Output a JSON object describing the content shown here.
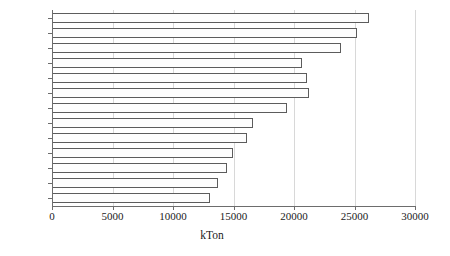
{
  "chart_data": {
    "type": "bar",
    "orientation": "horizontal",
    "title": "",
    "xlabel": "kTon",
    "ylabel": "",
    "categories": [
      "2009",
      "2010",
      "2011",
      "2012",
      "2013",
      "2014",
      "2015",
      "2016",
      "2017",
      "2018",
      "2019",
      "2020",
      "2021"
    ],
    "values": [
      13050,
      13700,
      14450,
      14950,
      16100,
      16600,
      19400,
      21250,
      21100,
      20650,
      23900,
      25200,
      26200
    ],
    "display_order_top_to_bottom": [
      "2021",
      "2020",
      "2019",
      "2018",
      "2017",
      "2016",
      "2015",
      "2014",
      "2013",
      "2012",
      "2011",
      "2010",
      "2009"
    ],
    "xlim": [
      0,
      30000
    ],
    "xticks": [
      0,
      5000,
      10000,
      15000,
      20000,
      25000,
      30000
    ],
    "xticklabels": [
      "0",
      "5000",
      "10000",
      "15000",
      "20000",
      "25000",
      "30000"
    ],
    "grid": true,
    "grid_axis": "x",
    "legend": null,
    "bar_fill_color": "#fdfdfd",
    "bar_border_color": "#5c5c5c",
    "gridline_color": "#d8d8d8",
    "axis_color": "#6d6d6d",
    "units": "kTon"
  }
}
